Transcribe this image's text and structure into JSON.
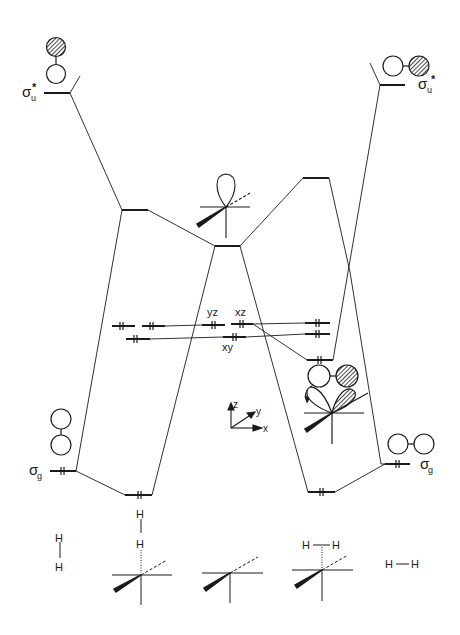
{
  "diagram": {
    "type": "molecular-orbital correlation diagram",
    "labels": {
      "sigma_u_star_left": "σ",
      "sigma_u_star_left_sub": "u",
      "sigma_u_star_left_sup": "*",
      "sigma_u_star_right": "σ",
      "sigma_u_star_right_sub": "u",
      "sigma_u_star_right_sup": "*",
      "sigma_g_left": "σ",
      "sigma_g_left_sub": "g",
      "sigma_g_right": "σ",
      "sigma_g_right_sub": "g",
      "d_yz": "yz",
      "d_xz": "xz",
      "d_xy": "xy",
      "axis_z": "z",
      "axis_y": "y",
      "axis_x": "x"
    },
    "structures": {
      "left_h2_top": "H",
      "left_h2_bottom": "H",
      "end_on_h_top": "H",
      "end_on_h_bottom": "H",
      "side_on_h_left": "H",
      "side_on_h_right": "H",
      "right_h2_left": "H",
      "right_h2_right": "H"
    },
    "colors": {
      "ink": "#1a1a1a",
      "background": "#ffffff"
    }
  }
}
